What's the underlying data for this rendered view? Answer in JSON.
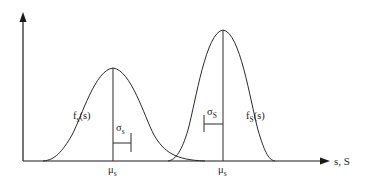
{
  "diagram": {
    "type": "stress-strength interference",
    "axes": {
      "x_label": "s, S",
      "y_label": ""
    },
    "curves": [
      {
        "id": "stress",
        "label_main": "f",
        "label_sub": "s",
        "label_arg": "(s)",
        "mean_label_main": "μ",
        "mean_label_sub": "s",
        "sigma_label_main": "σ",
        "sigma_label_sub": "s"
      },
      {
        "id": "strength",
        "label_main": "f",
        "label_sub": "S",
        "label_arg": "(s)",
        "mean_label_main": "μ",
        "mean_label_sub": "s",
        "sigma_label_main": "σ",
        "sigma_label_sub": "S"
      }
    ]
  },
  "colors": {
    "line": "#2a2a2a",
    "background": "#ffffff"
  }
}
